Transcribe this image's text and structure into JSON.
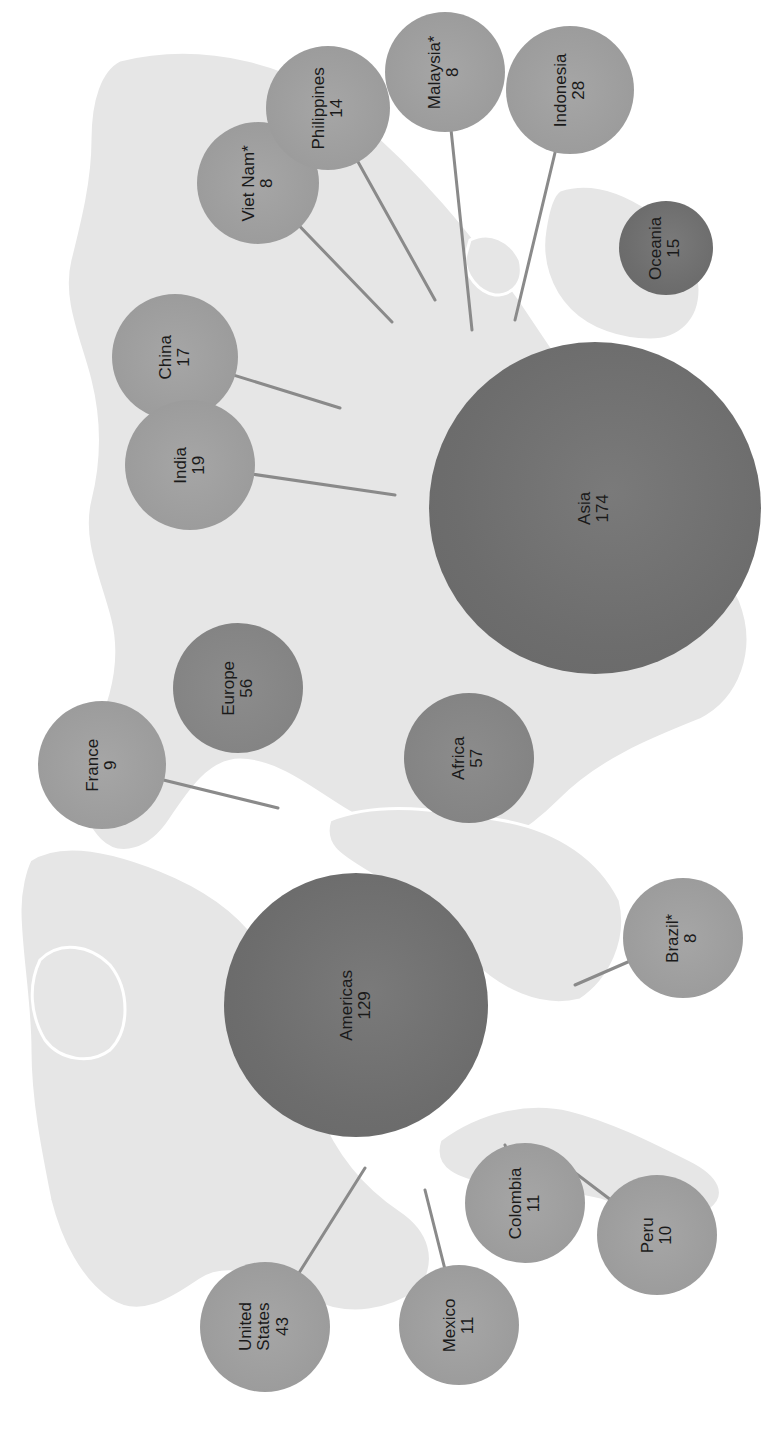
{
  "chart_data": {
    "type": "bubble-map",
    "title": "",
    "orientation": "map and labels rotated 90° counter-clockwise",
    "regions": [
      {
        "name": "Asia",
        "value": 174
      },
      {
        "name": "Americas",
        "value": 129
      },
      {
        "name": "Africa",
        "value": 57
      },
      {
        "name": "Europe",
        "value": 56
      },
      {
        "name": "Oceania",
        "value": 15
      }
    ],
    "countries": [
      {
        "name": "United States",
        "value": 43,
        "region": "Americas"
      },
      {
        "name": "Indonesia",
        "value": 28,
        "region": "Asia"
      },
      {
        "name": "India",
        "value": 19,
        "region": "Asia"
      },
      {
        "name": "China",
        "value": 17,
        "region": "Asia"
      },
      {
        "name": "Philippines",
        "value": 14,
        "region": "Asia"
      },
      {
        "name": "Mexico",
        "value": 11,
        "region": "Americas"
      },
      {
        "name": "Colombia",
        "value": 11,
        "region": "Americas"
      },
      {
        "name": "Peru",
        "value": 10,
        "region": "Americas"
      },
      {
        "name": "France",
        "value": 9,
        "region": "Europe"
      },
      {
        "name": "Viet Nam*",
        "value": 8,
        "region": "Asia"
      },
      {
        "name": "Malaysia*",
        "value": 8,
        "region": "Asia"
      },
      {
        "name": "Brazil*",
        "value": 8,
        "region": "Americas"
      }
    ]
  },
  "colors": {
    "region_bubble": "#6f6f6f",
    "europe_africa_bubble": "#808080",
    "country_bubble": "#9e9e9e",
    "land": "#e6e6e6",
    "leader_line": "#8a8a8a",
    "label_text": "#1a1a1a"
  },
  "bubbles": [
    {
      "id": "viet-nam",
      "name": "Viet Nam*",
      "value": "8",
      "cx": 258,
      "cy": 183,
      "r": 61,
      "kind": "country",
      "target": [
        392,
        322
      ]
    },
    {
      "id": "philippines",
      "name": "Philippines",
      "value": "14",
      "cx": 328,
      "cy": 108,
      "r": 62,
      "kind": "country",
      "target": [
        435,
        300
      ]
    },
    {
      "id": "malaysia",
      "name": "Malaysia*",
      "value": "8",
      "cx": 445,
      "cy": 72,
      "r": 60,
      "kind": "country",
      "target": [
        472,
        330
      ]
    },
    {
      "id": "indonesia",
      "name": "Indonesia",
      "value": "28",
      "cx": 570,
      "cy": 90,
      "r": 64,
      "kind": "country",
      "target": [
        515,
        320
      ]
    },
    {
      "id": "oceania",
      "name": "Oceania",
      "value": "15",
      "cx": 666,
      "cy": 248,
      "r": 47,
      "kind": "region-dark",
      "target": null
    },
    {
      "id": "china",
      "name": "China",
      "value": "17",
      "cx": 175,
      "cy": 357,
      "r": 63,
      "kind": "country",
      "target": [
        340,
        408
      ]
    },
    {
      "id": "india",
      "name": "India",
      "value": "19",
      "cx": 190,
      "cy": 465,
      "r": 65,
      "kind": "country",
      "target": [
        395,
        495
      ]
    },
    {
      "id": "asia",
      "name": "Asia",
      "value": "174",
      "cx": 595,
      "cy": 508,
      "r": 166,
      "kind": "region",
      "target": null
    },
    {
      "id": "france",
      "name": "France",
      "value": "9",
      "cx": 102,
      "cy": 765,
      "r": 64,
      "kind": "country",
      "target": [
        278,
        808
      ]
    },
    {
      "id": "europe",
      "name": "Europe",
      "value": "56",
      "cx": 238,
      "cy": 688,
      "r": 65,
      "kind": "region-dark",
      "target": null
    },
    {
      "id": "africa",
      "name": "Africa",
      "value": "57",
      "cx": 469,
      "cy": 758,
      "r": 65,
      "kind": "region-dark",
      "target": null
    },
    {
      "id": "americas",
      "name": "Americas",
      "value": "129",
      "cx": 356,
      "cy": 1005,
      "r": 132,
      "kind": "region",
      "target": null
    },
    {
      "id": "brazil",
      "name": "Brazil*",
      "value": "8",
      "cx": 683,
      "cy": 938,
      "r": 60,
      "kind": "country",
      "target": [
        575,
        985
      ]
    },
    {
      "id": "united-states",
      "name": "United\nStates",
      "value": "43",
      "cx": 265,
      "cy": 1327,
      "r": 65,
      "kind": "country",
      "target": [
        365,
        1168
      ]
    },
    {
      "id": "mexico",
      "name": "Mexico",
      "value": "11",
      "cx": 459,
      "cy": 1325,
      "r": 60,
      "kind": "country",
      "target": [
        425,
        1190
      ]
    },
    {
      "id": "colombia",
      "name": "Colombia",
      "value": "11",
      "cx": 525,
      "cy": 1203,
      "r": 60,
      "kind": "country",
      "target": [
        505,
        1145
      ]
    },
    {
      "id": "peru",
      "name": "Peru",
      "value": "10",
      "cx": 657,
      "cy": 1235,
      "r": 60,
      "kind": "country",
      "target": [
        545,
        1150
      ]
    }
  ]
}
